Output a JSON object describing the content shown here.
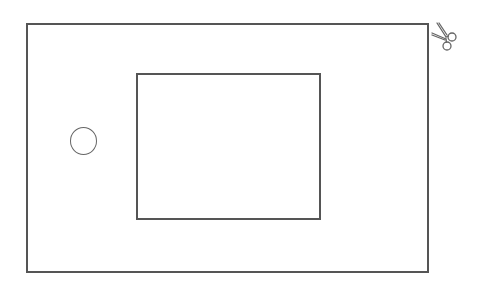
{
  "diagram": {
    "type": "cut-out template sketch",
    "shapes": [
      {
        "id": "outer-rect",
        "kind": "rectangle",
        "x": 26,
        "y": 23,
        "width": 403,
        "height": 250
      },
      {
        "id": "inner-rect",
        "kind": "rectangle",
        "x": 136,
        "y": 73,
        "width": 185,
        "height": 147
      },
      {
        "id": "circle-hole",
        "kind": "circle",
        "cx": 83,
        "cy": 141,
        "r": 13
      }
    ],
    "icons": [
      {
        "id": "scissors-icon",
        "meaning": "cut here",
        "x": 429,
        "y": 20
      }
    ],
    "stroke_color": "#555555",
    "background_color": "#ffffff"
  }
}
